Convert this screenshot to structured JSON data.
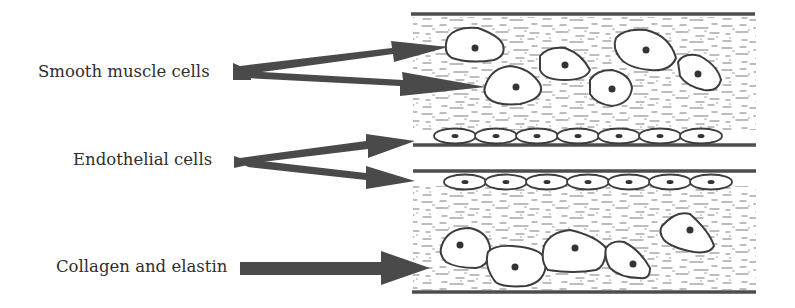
{
  "diagram": {
    "labels": [
      {
        "id": "smooth_muscle",
        "text": "Smooth muscle cells"
      },
      {
        "id": "endothelial",
        "text": "Endothelial cells"
      },
      {
        "id": "collagen",
        "text": "Collagen and elastin"
      }
    ],
    "colors": {
      "arrow": "#4a4a4a",
      "wall_line": "#4d4d4d",
      "cell_outline": "#3c3c3c",
      "nucleus": "#333333",
      "matrix_fibers": "#8a8a8a",
      "text": "#2e2e2e"
    },
    "structures": {
      "upper_layer": "smooth muscle cells in collagen/elastin matrix",
      "lumen_boundary_cells": "endothelial cells lining",
      "lower_layer": "smooth muscle cells in collagen/elastin matrix"
    }
  }
}
